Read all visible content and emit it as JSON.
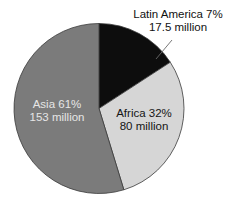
{
  "chart_data": {
    "type": "pie",
    "title": "",
    "unit": "million",
    "categories": [
      "Latin America",
      "Africa",
      "Asia"
    ],
    "values": [
      17.5,
      80,
      153
    ],
    "percentages": [
      7,
      32,
      61
    ],
    "series": [
      {
        "name": "Population",
        "slices": [
          {
            "label": "Latin America",
            "percent": 7,
            "value": 17.5,
            "percent_text": "Latin America 7%",
            "value_text": "17.5 million",
            "color": "#0d0d0d",
            "start_deg": 0,
            "end_deg": 57,
            "label_position": "outside",
            "leader_line": true
          },
          {
            "label": "Africa",
            "percent": 32,
            "value": 80,
            "percent_text": "Africa 32%",
            "value_text": "80 million",
            "color": "#d6d6d6",
            "start_deg": 57,
            "end_deg": 163,
            "label_position": "inside"
          },
          {
            "label": "Asia",
            "percent": 61,
            "value": 153,
            "percent_text": "Asia 61%",
            "value_text": "153 million",
            "color": "#7b7b7b",
            "start_deg": 163,
            "end_deg": 360,
            "label_position": "inside"
          }
        ]
      }
    ],
    "legend": "none",
    "start_angle": "12 o'clock, clockwise"
  },
  "labels": {
    "latin_america": {
      "line1": "Latin America 7%",
      "line2": "17.5 million"
    },
    "africa": {
      "line1": "Africa 32%",
      "line2": "80 million"
    },
    "asia": {
      "line1": "Asia 61%",
      "line2": "153 million"
    }
  }
}
